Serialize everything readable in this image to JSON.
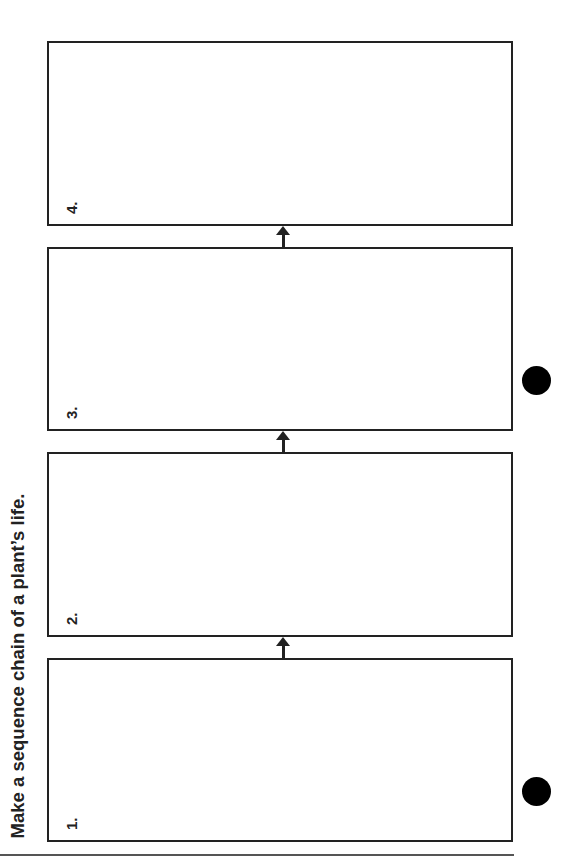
{
  "title": "Make a sequence chain of a plant’s life.",
  "boxes": [
    {
      "label": "1."
    },
    {
      "label": "2."
    },
    {
      "label": "3."
    },
    {
      "label": "4."
    }
  ],
  "connector_icon": "arrow-up-icon",
  "colors": {
    "stroke": "#222222",
    "background": "#ffffff",
    "dot": "#000000"
  }
}
